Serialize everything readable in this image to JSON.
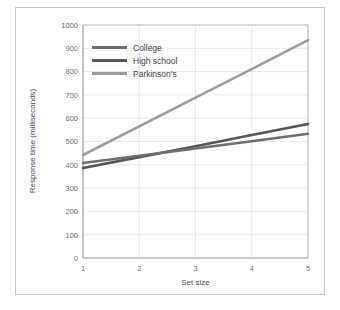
{
  "figure": {
    "frame_color": "#c8c8c8",
    "background": "#ffffff"
  },
  "chart_data": {
    "type": "line",
    "title": "",
    "xlabel": "Set size",
    "ylabel": "Response time (milliseconds)",
    "x": [
      1,
      2,
      3,
      4,
      5
    ],
    "xlim": [
      1,
      5
    ],
    "ylim": [
      0,
      1000
    ],
    "xticks": [
      "1",
      "2",
      "3",
      "4",
      "5"
    ],
    "yticks": [
      "0",
      "100",
      "200",
      "300",
      "400",
      "500",
      "600",
      "700",
      "800",
      "900",
      "1000"
    ],
    "grid": true,
    "legend_position": "upper left inside plot",
    "series": [
      {
        "name": "College",
        "color": "#6e6e6e",
        "values": [
          408,
          439,
          470,
          501,
          533
        ]
      },
      {
        "name": "High school",
        "color": "#565656",
        "values": [
          386,
          433,
          480,
          528,
          575
        ]
      },
      {
        "name": "Parkinson's",
        "color": "#9c9c9c",
        "values": [
          442,
          565,
          688,
          811,
          935
        ]
      }
    ]
  }
}
